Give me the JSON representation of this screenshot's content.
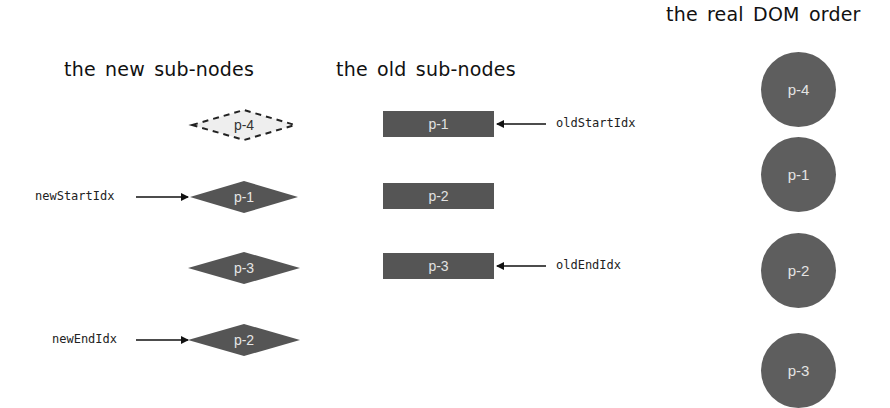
{
  "headings": {
    "new_sub_nodes": "the new sub-nodes",
    "old_sub_nodes": "the old sub-nodes",
    "real_dom_order": "the real DOM order"
  },
  "new_sub_nodes": [
    {
      "label": "p-4",
      "style": "dashed"
    },
    {
      "label": "p-1",
      "style": "solid"
    },
    {
      "label": "p-3",
      "style": "solid"
    },
    {
      "label": "p-2",
      "style": "solid"
    }
  ],
  "old_sub_nodes": [
    {
      "label": "p-1"
    },
    {
      "label": "p-2"
    },
    {
      "label": "p-3"
    }
  ],
  "real_dom_nodes": [
    {
      "label": "p-4"
    },
    {
      "label": "p-1"
    },
    {
      "label": "p-2"
    },
    {
      "label": "p-3"
    }
  ],
  "pointers": {
    "new_start": "newStartIdx",
    "new_end": "newEndIdx",
    "old_start": "oldStartIdx",
    "old_end": "oldEndIdx"
  },
  "colors": {
    "node_fill": "#555555",
    "circle_fill": "#5e5e5e",
    "node_text": "#e4e4e4",
    "dashed_fill": "#eeeeee",
    "arrow": "#111111"
  }
}
